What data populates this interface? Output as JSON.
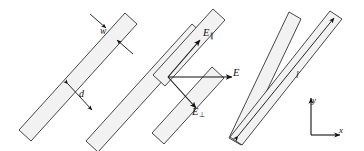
{
  "figure": {
    "background_color": "#ffffff",
    "strip_fill_color": "#f2f2f2",
    "stroke_color": "#1a1a1a"
  },
  "labels": {
    "width": "w",
    "gap": "d",
    "length": "l",
    "field": "E",
    "field_parallel_base": "E",
    "field_parallel_sub": "∥",
    "field_perpendicular_base": "E",
    "field_perpendicular_sub": "⊥"
  },
  "axes": {
    "x_label": "x",
    "y_label": "y"
  },
  "strips": [
    {
      "name": "strip-1",
      "label": "leftmost strip"
    },
    {
      "name": "strip-2",
      "label": "second strip"
    },
    {
      "name": "strip-3",
      "label": "third strip"
    },
    {
      "name": "strip-4",
      "label": "fourth strip"
    }
  ],
  "vectors": [
    {
      "name": "E-parallel",
      "label": "E∥",
      "direction": "up-right along strip axis"
    },
    {
      "name": "E-total",
      "label": "E",
      "direction": "horizontal right"
    },
    {
      "name": "E-perpendicular",
      "label": "E⊥",
      "direction": "down-right across strip axis"
    }
  ],
  "dimensions": [
    {
      "name": "strip-width",
      "label": "w",
      "style": "double arrow across strip width"
    },
    {
      "name": "strip-gap",
      "label": "d",
      "style": "double arrow between adjacent strips"
    },
    {
      "name": "strip-length",
      "label": "l",
      "style": "double arrow along strip length"
    }
  ]
}
